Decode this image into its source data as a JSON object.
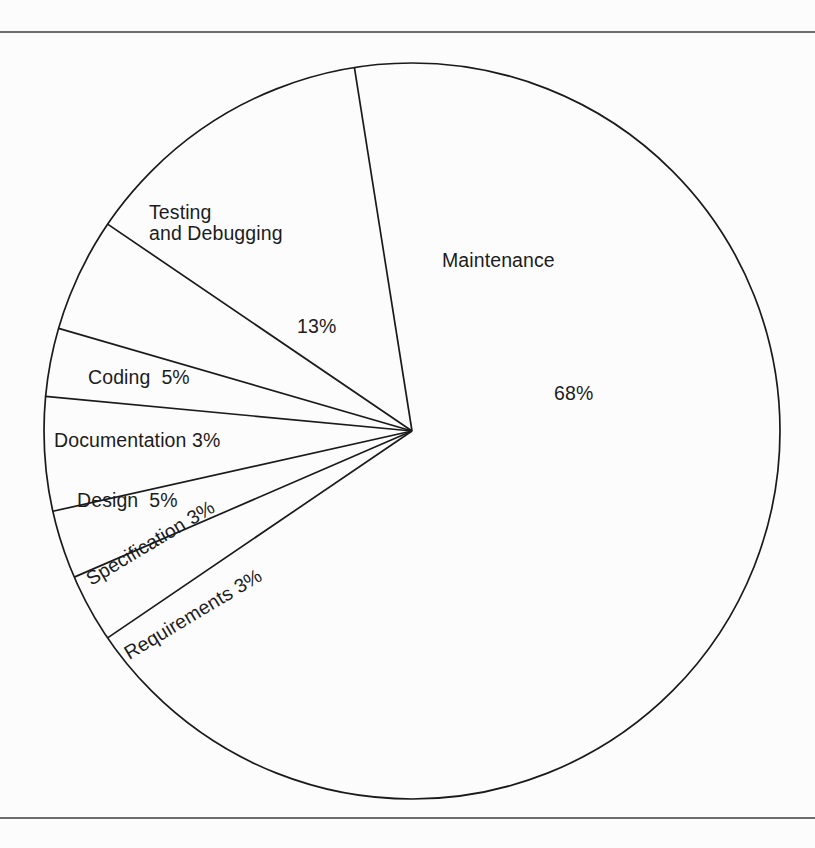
{
  "figure": {
    "title": "",
    "top_rule_color": "#6d6d6d",
    "bottom_rule_color": "#6d6d6d",
    "background": "#fcfcfc",
    "line_color": "#1a1a1a"
  },
  "labels": {
    "testing": "Testing\nand Debugging",
    "testing_pct": "13%",
    "maintenance": "Maintenance",
    "maintenance_pct": "68%",
    "coding": "Coding  5%",
    "documentation": "Documentation 3%",
    "design": "Design  5%",
    "specification": "Specification 3%",
    "requirements": "Requirements 3%"
  },
  "chart_data": {
    "type": "pie",
    "title": "",
    "subtitle": "",
    "xlabel": "",
    "ylabel": "",
    "legend_position": "none",
    "grid": false,
    "unit": "%",
    "total": 100,
    "center": [
      412,
      398
    ],
    "radius": 368,
    "start_angle_deg": -99,
    "direction": "counterclockwise",
    "categories": [
      "Testing and Debugging",
      "Coding",
      "Documentation",
      "Design",
      "Specification",
      "Requirements",
      "Maintenance"
    ],
    "values": [
      13,
      5,
      3,
      5,
      3,
      3,
      68
    ],
    "slices": [
      {
        "label": "Testing and Debugging",
        "value": 13,
        "value_label": "13%"
      },
      {
        "label": "Coding",
        "value": 5,
        "value_label": "5%"
      },
      {
        "label": "Documentation",
        "value": 3,
        "value_label": "3%"
      },
      {
        "label": "Design",
        "value": 5,
        "value_label": "5%"
      },
      {
        "label": "Specification",
        "value": 3,
        "value_label": "3%"
      },
      {
        "label": "Requirements",
        "value": 3,
        "value_label": "3%"
      },
      {
        "label": "Maintenance",
        "value": 68,
        "value_label": "68%"
      }
    ]
  }
}
